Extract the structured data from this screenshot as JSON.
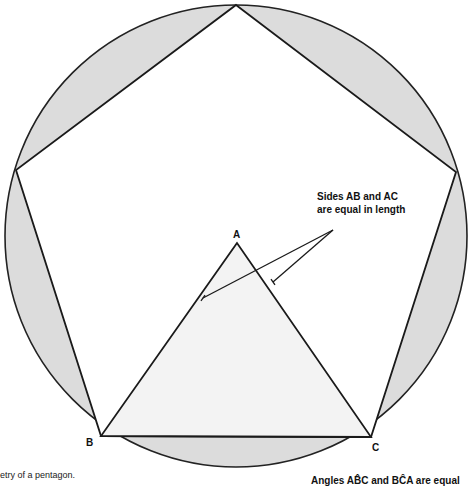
{
  "diagram": {
    "circle": {
      "cx": 236,
      "cy": 236,
      "r": 231,
      "fill": "#dcdcdc",
      "stroke": "#222222"
    },
    "pentagon": {
      "points": [
        [
          236,
          5
        ],
        [
          456,
          172
        ],
        [
          371,
          437
        ],
        [
          101,
          436
        ],
        [
          16,
          170
        ]
      ],
      "fill": "#ffffff",
      "stroke": "#1a1a1a"
    },
    "triangle": {
      "vertices": {
        "A": [
          237,
          243
        ],
        "B": [
          101,
          436
        ],
        "C": [
          371,
          437
        ]
      },
      "fill": "#f3f3f3",
      "stroke": "#1a1a1a"
    },
    "labels": {
      "A": "A",
      "B": "B",
      "C": "C"
    },
    "annotations": {
      "sides_line1": "Sides AB and AC",
      "sides_line2": "are equal in length",
      "angles": "Angles AB̂C and BĈA are equal"
    },
    "leader_lines": {
      "origin": [
        333,
        230
      ],
      "targets": [
        [
          203,
          298
        ],
        [
          273,
          282
        ]
      ]
    },
    "caption": "etry of a pentagon."
  }
}
